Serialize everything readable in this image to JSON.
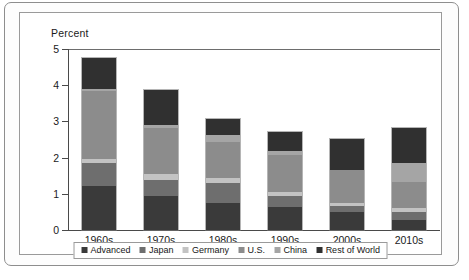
{
  "chart_data": {
    "type": "bar",
    "subtype": "stacked-vertical",
    "title": "",
    "ylabel": "Percent",
    "xlabel": "",
    "ylim": [
      0,
      5
    ],
    "yticks": [
      0,
      1,
      2,
      3,
      4,
      5
    ],
    "ytick_labels": [
      "0",
      "1",
      "2",
      "3",
      "4",
      "5"
    ],
    "grid": false,
    "legend_position": "bottom-inside",
    "categories": [
      "1960s",
      "1970s",
      "1980s",
      "1990s",
      "2000s",
      "2010s"
    ],
    "series": [
      {
        "name": "Advanced",
        "color": "#3a3a3a",
        "values": [
          1.22,
          0.95,
          0.74,
          0.63,
          0.5,
          0.29
        ]
      },
      {
        "name": "Japan",
        "color": "#6e6e6e",
        "values": [
          0.63,
          0.43,
          0.56,
          0.3,
          0.15,
          0.21
        ]
      },
      {
        "name": "Germany",
        "color": "#c3c3c3",
        "values": [
          0.12,
          0.17,
          0.14,
          0.13,
          0.1,
          0.11
        ]
      },
      {
        "name": "U.S.",
        "color": "#8c8c8c",
        "values": [
          1.87,
          1.27,
          0.99,
          1.0,
          0.9,
          0.73
        ]
      },
      {
        "name": "China",
        "color": "#a5a5a5",
        "values": [
          0.06,
          0.08,
          0.19,
          0.11,
          0.01,
          0.5
        ]
      },
      {
        "name": "Rest of World",
        "color": "#303030",
        "values": [
          0.85,
          0.98,
          0.46,
          0.55,
          0.86,
          0.99
        ]
      }
    ],
    "totals": [
      4.75,
      3.88,
      3.08,
      2.72,
      2.52,
      2.83
    ]
  },
  "legend": {
    "items": [
      {
        "label": "Advanced"
      },
      {
        "label": "Japan"
      },
      {
        "label": "Germany"
      },
      {
        "label": "U.S."
      },
      {
        "label": "China"
      },
      {
        "label": "Rest of World"
      }
    ]
  }
}
